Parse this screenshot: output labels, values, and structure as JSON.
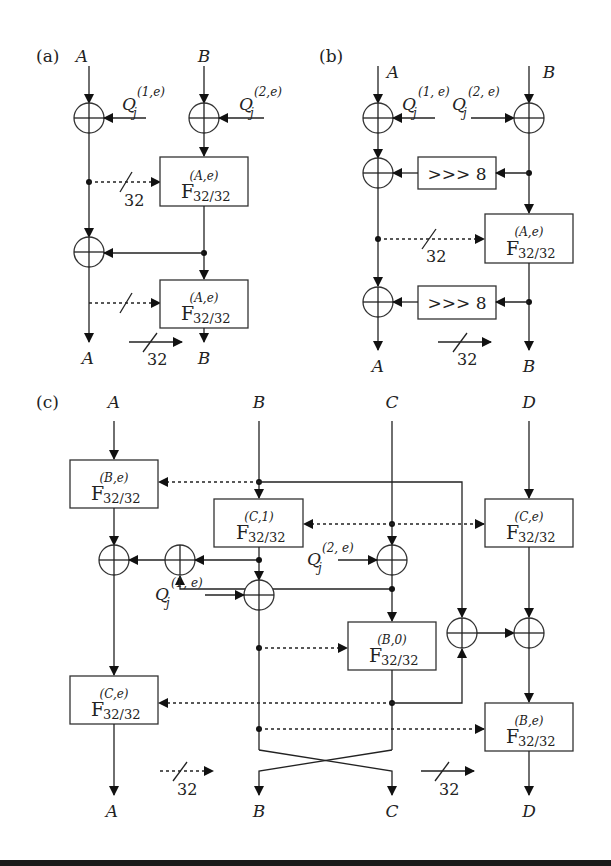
{
  "figure": {
    "panels": [
      {
        "id": "a",
        "label": "(a)",
        "inputs": [
          "A",
          "B"
        ],
        "outputs": [
          "A",
          "B"
        ],
        "keys": [
          "Q",
          "Q"
        ],
        "key_sub": "j",
        "key_sups": [
          "(1,e)",
          "(2,e)"
        ],
        "f_boxes": [
          {
            "main": "F",
            "sub": "32/32",
            "sup": "(A,e)"
          },
          {
            "main": "F",
            "sub": "32/32",
            "sup": "(A,e)"
          }
        ],
        "bus_widths": [
          "32",
          "32"
        ]
      },
      {
        "id": "b",
        "label": "(b)",
        "inputs": [
          "A",
          "B"
        ],
        "outputs": [
          "A",
          "B"
        ],
        "keys": [
          "Q",
          "Q"
        ],
        "key_sub": "j",
        "key_sups": [
          "(1, e)",
          "(2, e)"
        ],
        "rot_boxes": [
          ">>> 8",
          ">>> 8"
        ],
        "f_boxes": [
          {
            "main": "F",
            "sub": "32/32",
            "sup": "(A,e)"
          }
        ],
        "bus_widths": [
          "32",
          "32"
        ]
      },
      {
        "id": "c",
        "label": "(c)",
        "inputs": [
          "A",
          "B",
          "C",
          "D"
        ],
        "outputs": [
          "A",
          "B",
          "C",
          "D"
        ],
        "keys": [
          "Q",
          "Q"
        ],
        "key_sub": "j",
        "key_sups": [
          "(2, e)",
          "(1, e)"
        ],
        "f_boxes": [
          {
            "main": "F",
            "sub": "32/32",
            "sup": "(B,e)"
          },
          {
            "main": "F",
            "sub": "32/32",
            "sup": "(C,1)"
          },
          {
            "main": "F",
            "sub": "32/32",
            "sup": "(C,e)"
          },
          {
            "main": "F",
            "sub": "32/32",
            "sup": "(B,0)"
          },
          {
            "main": "F",
            "sub": "32/32",
            "sup": "(C,e)"
          },
          {
            "main": "F",
            "sub": "32/32",
            "sup": "(B,e)"
          }
        ],
        "bus_widths": [
          "32",
          "32"
        ]
      }
    ]
  }
}
